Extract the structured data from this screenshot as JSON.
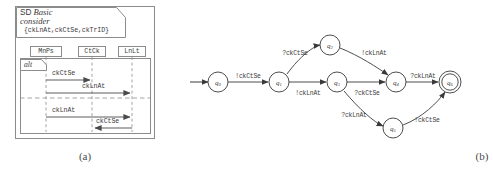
{
  "figure_a": {
    "name": "sequence-diagram",
    "caption": "(a)",
    "frame_tag": {
      "keyword": "SD",
      "name": "Basic",
      "operator": "consider",
      "message_set": "{ckLnAt,ckCtSe,ckTrID}"
    },
    "lifelines": [
      {
        "label": "MnPs"
      },
      {
        "label": "CtCk"
      },
      {
        "label": "LnLt"
      }
    ],
    "fragment": {
      "operator": "alt"
    },
    "messages": [
      {
        "label": "ckCtSe",
        "from": "MnPs",
        "to": "CtCk",
        "direction": "right",
        "operand": "1"
      },
      {
        "label": "ckLnAt",
        "from": "MnPs",
        "to": "LnLt",
        "direction": "right",
        "operand": "1"
      },
      {
        "label": "ckLnAt",
        "from": "MnPs",
        "to": "LnLt",
        "direction": "right",
        "operand": "2"
      },
      {
        "label": "ckCtSe",
        "from": "LnLt",
        "to": "CtCk",
        "direction": "left",
        "operand": "2"
      }
    ]
  },
  "figure_b": {
    "name": "automaton",
    "caption": "(b)",
    "states": [
      {
        "id": "q0",
        "label": "q",
        "sub": "0",
        "accepting": false,
        "initial": true,
        "cx": 36,
        "cy": 82
      },
      {
        "id": "q1",
        "label": "q",
        "sub": "1",
        "accepting": false,
        "initial": false,
        "cx": 97,
        "cy": 82
      },
      {
        "id": "q2",
        "label": "q",
        "sub": "2",
        "accepting": false,
        "initial": false,
        "cx": 148,
        "cy": 45
      },
      {
        "id": "q3",
        "label": "q",
        "sub": "3",
        "accepting": false,
        "initial": false,
        "cx": 155,
        "cy": 82
      },
      {
        "id": "q4",
        "label": "q",
        "sub": "4",
        "accepting": false,
        "initial": false,
        "cx": 214,
        "cy": 82
      },
      {
        "id": "q5",
        "label": "q",
        "sub": "5",
        "accepting": false,
        "initial": false,
        "cx": 211,
        "cy": 128
      },
      {
        "id": "q6",
        "label": "q",
        "sub": "6",
        "accepting": true,
        "initial": false,
        "cx": 268,
        "cy": 82
      }
    ],
    "transitions": [
      {
        "from": "q0",
        "to": "q1",
        "label": "!ckCtSe",
        "lx": 66,
        "ly": 78
      },
      {
        "from": "q1",
        "to": "q2",
        "label": "?ckCtSe",
        "lx": 113,
        "ly": 55
      },
      {
        "from": "q2",
        "to": "q4",
        "label": "!ckLnAt",
        "lx": 192,
        "ly": 55
      },
      {
        "from": "q1",
        "to": "q3",
        "label": "!ckLnAt",
        "lx": 126,
        "ly": 95
      },
      {
        "from": "q3",
        "to": "q4",
        "label": "?ckCtSe",
        "lx": 185,
        "ly": 95
      },
      {
        "from": "q4",
        "to": "q6",
        "label": "?ckLnAt",
        "lx": 241,
        "ly": 78
      },
      {
        "from": "q3",
        "to": "q5",
        "label": "?ckLnAt",
        "lx": 172,
        "ly": 117
      },
      {
        "from": "q5",
        "to": "q6",
        "label": "!ckCtSe",
        "lx": 245,
        "ly": 122
      }
    ]
  }
}
